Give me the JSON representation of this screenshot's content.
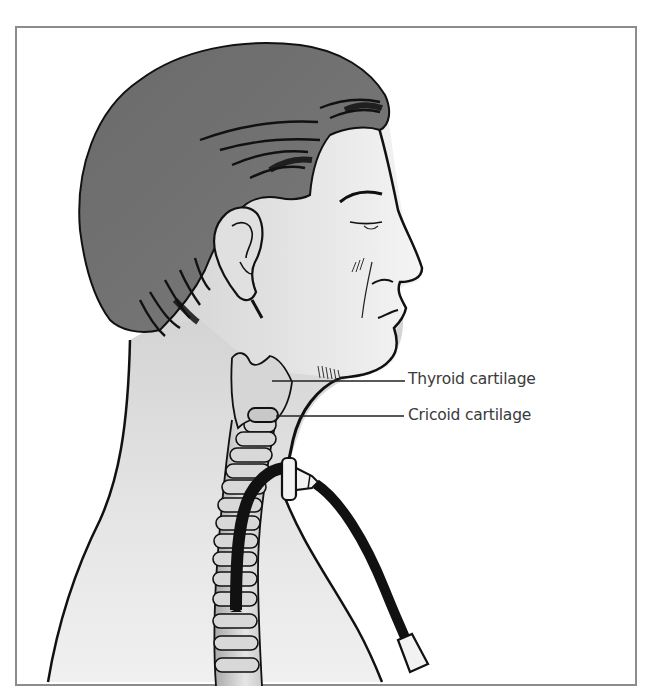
{
  "figure": {
    "labels": [
      {
        "id": "thyroid",
        "text": "Thyroid cartilage"
      },
      {
        "id": "cricoid",
        "text": "Cricoid cartilage"
      }
    ]
  },
  "colors": {
    "frame_border": "#8c8c8c",
    "hair": "#6e6e6e",
    "skin": "#d9d9d9",
    "outline": "#111111",
    "cartilage": "#cfcfcf",
    "tube": "#111111",
    "label_text": "#3a3a3a"
  }
}
